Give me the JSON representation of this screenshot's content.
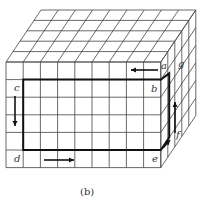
{
  "figure": {
    "caption": "(b)",
    "grid": {
      "columns": 9,
      "rows": 6,
      "depth": 5
    },
    "labels": {
      "a": "a",
      "b": "b",
      "c": "c",
      "d": "d",
      "e": "e",
      "f": "f",
      "g": "g"
    },
    "colors": {
      "line": "#333333",
      "path": "#111111",
      "background": "#ffffff"
    }
  }
}
